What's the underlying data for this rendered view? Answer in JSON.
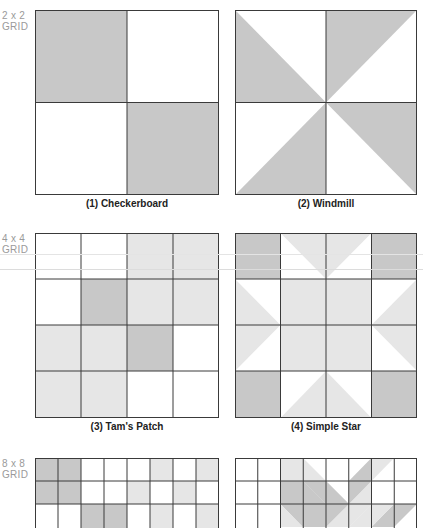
{
  "colors": {
    "dark": "#c8c8c8",
    "light": "#e6e6e6",
    "white": "#ffffff",
    "line": "#3a3a3a",
    "label": "#9a9a9a"
  },
  "rows": [
    {
      "label_line1": "2 x 2",
      "label_line2": "GRID"
    },
    {
      "label_line1": "4 x 4",
      "label_line2": "GRID"
    },
    {
      "label_line1": "8 x 8",
      "label_line2": "GRID"
    }
  ],
  "blocks": [
    {
      "caption": "(1) Checkerboard",
      "grid": 2
    },
    {
      "caption": "(2) Windmill",
      "grid": 2
    },
    {
      "caption": "(3) Tam's Patch",
      "grid": 4
    },
    {
      "caption": "(4) Simple Star",
      "grid": 4
    },
    {
      "caption": "",
      "grid": 8
    },
    {
      "caption": "",
      "grid": 8
    }
  ]
}
